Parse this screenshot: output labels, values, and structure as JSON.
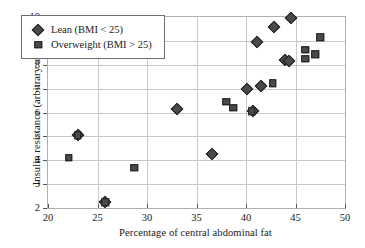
{
  "chart_data": {
    "type": "scatter",
    "title": "",
    "xlabel": "Percentage of central abdominal fat",
    "ylabel": "Insulin resistance (arbitrary units)",
    "xlim": [
      20,
      50
    ],
    "ylim": [
      2,
      10
    ],
    "xticks": [
      20,
      25,
      30,
      35,
      40,
      45,
      50
    ],
    "yticks": [
      2,
      3,
      4,
      5,
      6,
      7,
      8,
      9,
      10
    ],
    "grid": true,
    "legend_position": "upper left",
    "marker_color": "#4a4a4a",
    "marker_edge_color": "#1e1e1e",
    "series": [
      {
        "name": "Lean (BMI < 25)",
        "marker": "diamond",
        "points": [
          [
            23.0,
            5.05
          ],
          [
            25.8,
            2.25
          ],
          [
            33.0,
            6.15
          ],
          [
            36.6,
            4.28
          ],
          [
            40.1,
            7.0
          ],
          [
            40.7,
            6.08
          ],
          [
            41.1,
            8.97
          ],
          [
            41.5,
            7.13
          ],
          [
            42.8,
            9.6
          ],
          [
            43.9,
            8.2
          ],
          [
            44.3,
            8.15
          ],
          [
            44.5,
            9.95
          ]
        ]
      },
      {
        "name": "Overweight (BMI > 25)",
        "marker": "square",
        "points": [
          [
            22.1,
            4.1
          ],
          [
            23.0,
            5.05
          ],
          [
            25.8,
            2.25
          ],
          [
            28.7,
            3.68
          ],
          [
            38.0,
            6.44
          ],
          [
            38.7,
            6.2
          ],
          [
            40.6,
            6.05
          ],
          [
            42.7,
            7.22
          ],
          [
            46.0,
            8.62
          ],
          [
            46.0,
            8.25
          ],
          [
            47.0,
            8.45
          ],
          [
            47.5,
            9.16
          ]
        ]
      }
    ]
  }
}
